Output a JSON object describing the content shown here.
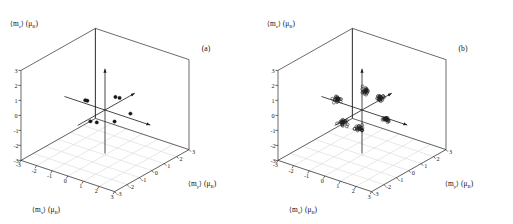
{
  "figure": {
    "background": "#ffffff",
    "ink": "#1a1a1a",
    "grid_color": "#d8d8d8"
  },
  "panels": [
    {
      "id": "a",
      "label": "(a)"
    },
    {
      "id": "b",
      "label": "(b)"
    }
  ],
  "axes": {
    "x": {
      "title_main": "⟨m",
      "title_sub": "x",
      "title_close": "⟩ (μ",
      "unit_sub": "B",
      "unit_close": ")",
      "full": "⟨m_x⟩ (μ_B)"
    },
    "y": {
      "title_main": "⟨m",
      "title_sub": "y",
      "title_close": "⟩ (μ",
      "unit_sub": "B",
      "unit_close": ")",
      "full": "⟨m_y⟩ (μ_B)"
    },
    "z": {
      "title_main": "⟨m",
      "title_sub": "z",
      "title_close": "⟩ (μ",
      "unit_sub": "B",
      "unit_close": ")",
      "full": "⟨m_z⟩ (μ_B)"
    },
    "ticks": [
      "-3",
      "-2",
      "-1",
      "0",
      "1",
      "2",
      "3"
    ],
    "range": [
      -3,
      3
    ]
  },
  "chart_data": [
    {
      "type": "scatter",
      "panel": "(a)",
      "title": "",
      "xlabel": "⟨m_x⟩ (μ_B)",
      "ylabel": "⟨m_y⟩ (μ_B)",
      "zlabel": "⟨m_z⟩ (μ_B)",
      "xlim": [
        -3,
        3
      ],
      "ylim": [
        -3,
        3
      ],
      "zlim": [
        -3,
        3
      ],
      "xticks": [
        -3,
        -2,
        -1,
        0,
        1,
        2,
        3
      ],
      "yticks": [
        -3,
        -2,
        -1,
        0,
        1,
        2,
        3
      ],
      "zticks": [
        -3,
        -2,
        -1,
        0,
        1,
        2,
        3
      ],
      "grid": true,
      "legend": "none",
      "marker": "filled-circle",
      "projection": "3d-axonometric",
      "series": [
        {
          "name": "moments",
          "marker": "filled-circle",
          "points": [
            {
              "x": -1.05,
              "y": -0.1,
              "z": 0.3
            },
            {
              "x": -1.7,
              "y": 0.55,
              "z": -0.2
            },
            {
              "x": 1.55,
              "y": 0.1,
              "z": 0.25
            },
            {
              "x": 1.05,
              "y": -0.55,
              "z": -0.15
            },
            {
              "x": 0.1,
              "y": 1.05,
              "z": 0.35
            },
            {
              "x": -0.1,
              "y": -1.05,
              "z": -0.3
            },
            {
              "x": 0.35,
              "y": 0.4,
              "z": 0.8
            },
            {
              "x": -0.25,
              "y": -0.35,
              "z": -0.75
            }
          ]
        }
      ]
    },
    {
      "type": "scatter",
      "panel": "(b)",
      "title": "",
      "xlabel": "⟨m_x⟩ (μ_B)",
      "ylabel": "⟨m_y⟩ (μ_B)",
      "zlabel": "⟨m_z⟩ (μ_B)",
      "xlim": [
        -3,
        3
      ],
      "ylim": [
        -3,
        3
      ],
      "zlim": [
        -3,
        3
      ],
      "xticks": [
        -3,
        -2,
        -1,
        0,
        1,
        2,
        3
      ],
      "yticks": [
        -3,
        -2,
        -1,
        0,
        1,
        2,
        3
      ],
      "zticks": [
        -3,
        -2,
        -1,
        0,
        1,
        2,
        3
      ],
      "grid": true,
      "legend": "none",
      "marker": "open-circle",
      "projection": "3d-axonometric",
      "series": [
        {
          "name": "moment-clusters",
          "marker": "open-circle",
          "cluster_count": 6,
          "cluster_centers": [
            {
              "x": -1.55,
              "y": 0.0,
              "z": 0.15
            },
            {
              "x": 1.55,
              "y": 0.0,
              "z": -0.1
            },
            {
              "x": 0.0,
              "y": 1.5,
              "z": 0.15
            },
            {
              "x": 0.0,
              "y": -1.5,
              "z": -0.15
            },
            {
              "x": 0.1,
              "y": 0.1,
              "z": 1.25
            },
            {
              "x": -0.1,
              "y": -0.1,
              "z": -1.25
            }
          ],
          "points_per_cluster": 22,
          "cluster_spread": 0.22
        }
      ]
    }
  ]
}
